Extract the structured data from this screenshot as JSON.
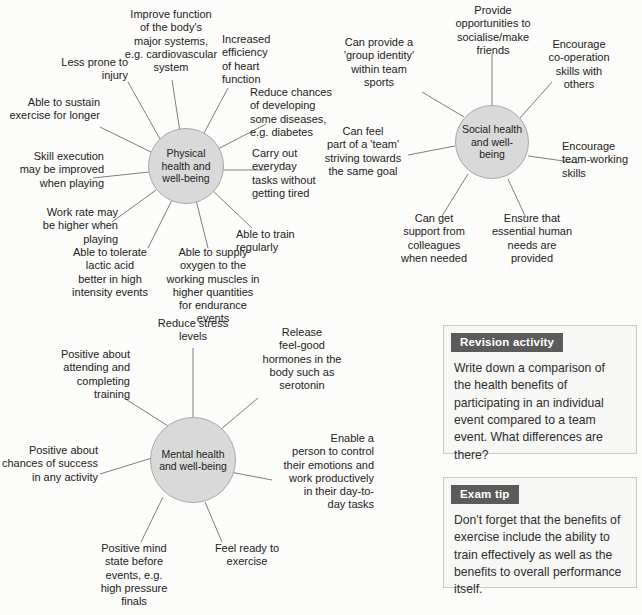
{
  "page": {
    "background": "#fcfcfa",
    "hub_fill": "#d9d9d9",
    "hub_stroke": "#a8a8a8",
    "spoke_stroke": "#6f6f6f",
    "callout_header_bg": "#5b5b5b",
    "callout_border": "#c9c9c4"
  },
  "diagrams": [
    {
      "id": "physical",
      "hub_label": "Physical health\nand well-being",
      "leaves": [
        {
          "id": "improve-function",
          "text": "Improve function\nof the body's\nmajor systems,\ne.g. cardiovascular\nsystem"
        },
        {
          "id": "increased-efficiency",
          "text": "Increased\nefficiency\nof heart\nfunction"
        },
        {
          "id": "reduce-chances-disease",
          "text": "Reduce chances\nof developing\nsome diseases,\ne.g. diabetes"
        },
        {
          "id": "carry-out-everyday-tasks",
          "text": "Carry out\neveryday\ntasks without\ngetting tired"
        },
        {
          "id": "able-to-train-regularly",
          "text": "Able to train\nregularly"
        },
        {
          "id": "able-to-supply-oxygen",
          "text": "Able to supply\noxygen to the\nworking muscles in\nhigher quantities\nfor endurance\nevents"
        },
        {
          "id": "tolerate-lactic-acid",
          "text": "Able to tolerate\nlactic acid\nbetter in high\nintensity events"
        },
        {
          "id": "work-rate-higher",
          "text": "Work rate may\nbe higher when\nplaying"
        },
        {
          "id": "skill-execution",
          "text": "Skill execution\nmay be improved\nwhen playing"
        },
        {
          "id": "sustain-exercise-longer",
          "text": "Able to sustain\nexercise for longer"
        },
        {
          "id": "less-prone-to-injury",
          "text": "Less prone to\ninjury"
        }
      ]
    },
    {
      "id": "social",
      "hub_label": "Social health\nand\nwell-being",
      "leaves": [
        {
          "id": "provide-opportunities-socialise",
          "text": "Provide\nopportunities to\nsocialise/make\nfriends"
        },
        {
          "id": "encourage-co-operation",
          "text": "Encourage\nco-operation\nskills with\nothers"
        },
        {
          "id": "encourage-team-working",
          "text": "Encourage\nteam-working\nskills"
        },
        {
          "id": "ensure-essential-human-needs",
          "text": "Ensure that\nessential human\nneeds are\nprovided"
        },
        {
          "id": "get-support-from-colleagues",
          "text": "Can get\nsupport from\ncolleagues\nwhen needed"
        },
        {
          "id": "feel-part-of-team",
          "text": "Can feel\npart of a 'team'\nstriving towards\nthe same goal"
        },
        {
          "id": "group-identity",
          "text": "Can provide a\n'group identity'\nwithin team\nsports"
        }
      ]
    },
    {
      "id": "mental",
      "hub_label": "Mental health\nand well-being",
      "leaves": [
        {
          "id": "reduce-stress-levels",
          "text": "Reduce stress\nlevels"
        },
        {
          "id": "release-feel-good-hormones",
          "text": "Release\nfeel-good\nhormones in the\nbody such as\nserotonin"
        },
        {
          "id": "enable-control-emotions",
          "text": "Enable a\nperson to control\ntheir emotions and\nwork productively\nin their day-to-\nday tasks"
        },
        {
          "id": "feel-ready-to-exercise",
          "text": "Feel ready to\nexercise"
        },
        {
          "id": "positive-mind-state",
          "text": "Positive mind\nstate before\nevents, e.g.\nhigh pressure\nfinals"
        },
        {
          "id": "positive-chances-of-success",
          "text": "Positive about\nchances of success\nin any activity"
        },
        {
          "id": "positive-attending-training",
          "text": "Positive about\nattending and\ncompleting\ntraining"
        }
      ]
    }
  ],
  "callouts": [
    {
      "id": "revision-activity",
      "title": "Revision activity",
      "body": "Write down a comparison of the health benefits of participating in an individual event compared to a team event. What differences are there?"
    },
    {
      "id": "exam-tip",
      "title": "Exam tip",
      "body": "Don't forget that the benefits of exercise include the ability to train effectively as well as the benefits to overall performance itself."
    }
  ]
}
